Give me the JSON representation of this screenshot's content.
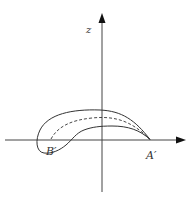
{
  "diagram": {
    "type": "coordinate-sketch",
    "axes": {
      "vertical_label": "z",
      "horizontal_label": ""
    },
    "points": [
      {
        "name": "A'",
        "label": "A′"
      },
      {
        "name": "B'",
        "label": "B′"
      }
    ],
    "curves": [
      {
        "name": "outer-boundary",
        "style": "solid"
      },
      {
        "name": "inner-boundary",
        "style": "solid"
      },
      {
        "name": "mean-line",
        "style": "dashed"
      }
    ],
    "colors": {
      "stroke": "#333333",
      "axis": "#444444",
      "background": "#ffffff"
    }
  }
}
